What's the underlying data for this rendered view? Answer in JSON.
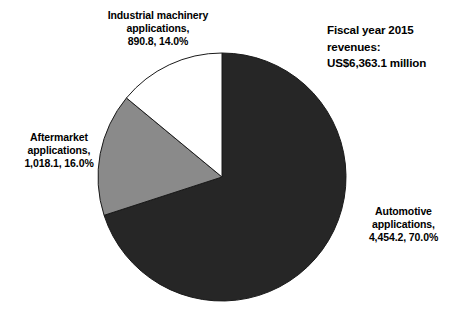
{
  "chart_data": {
    "type": "pie",
    "title": "Fiscal year 2015 revenues:\nUS$6,363.1 million",
    "title_lines": [
      "Fiscal year 2015",
      "revenues:",
      "US$6,363.1 million"
    ],
    "total": 6363.1,
    "units": "US$ million",
    "legend": "labels-outside",
    "grid": false,
    "categories": [
      "Automotive applications",
      "Aftermarket applications",
      "Industrial machinery applications"
    ],
    "values": [
      4454.2,
      1018.1,
      890.8
    ],
    "percentages": [
      70.0,
      16.0,
      14.0
    ],
    "colors": [
      "#262626",
      "#8a8a8a",
      "#ffffff"
    ],
    "slices": [
      {
        "name": "Automotive applications",
        "value": 4454.2,
        "value_text": "4,454.2",
        "percent": 70.0,
        "percent_text": "70.0%",
        "color": "#262626",
        "start_angle": 0,
        "end_angle": 252,
        "label": "Automotive\napplications,\n4,454.2, 70.0%"
      },
      {
        "name": "Aftermarket applications",
        "value": 1018.1,
        "value_text": "1,018.1",
        "percent": 16.0,
        "percent_text": "16.0%",
        "color": "#8a8a8a",
        "start_angle": 252,
        "end_angle": 309.6,
        "label": "Aftermarket\napplications,\n1,018.1, 16.0%"
      },
      {
        "name": "Industrial machinery applications",
        "value": 890.8,
        "value_text": "890.8",
        "percent": 14.0,
        "percent_text": "14.0%",
        "color": "#ffffff",
        "start_angle": 309.6,
        "end_angle": 360,
        "label": "Industrial machinery\napplications,\n890.8, 14.0%"
      }
    ],
    "xlabel": "",
    "ylabel": ""
  },
  "geometry": {
    "center_x": 222,
    "center_y": 177,
    "radius": 124,
    "outline_color": "#1a1a1a",
    "background": "#ffffff"
  }
}
